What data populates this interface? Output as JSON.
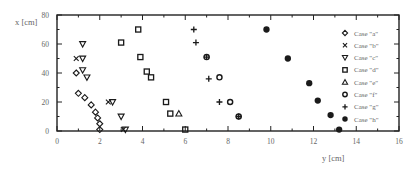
{
  "chart_data": {
    "type": "scatter",
    "title": "",
    "xlabel": "y [cm]",
    "ylabel": "x [cm]",
    "xlim": [
      0,
      16
    ],
    "ylim": [
      0,
      80
    ],
    "xticks": [
      "0",
      "2",
      "4",
      "6",
      "8",
      "10",
      "12",
      "14",
      "16"
    ],
    "yticks": [
      "0",
      "20",
      "40",
      "60",
      "80"
    ],
    "grid": false,
    "legend_position": "right-inside",
    "series": [
      {
        "name": "Case \"a\"",
        "marker": "diamond",
        "points": [
          [
            0.9,
            40
          ],
          [
            1.0,
            26
          ],
          [
            1.3,
            23
          ],
          [
            1.6,
            18
          ],
          [
            1.8,
            13
          ],
          [
            1.9,
            9
          ],
          [
            2.0,
            5
          ],
          [
            2.0,
            1
          ]
        ]
      },
      {
        "name": "Case \"b\"",
        "marker": "x",
        "points": [
          [
            0.9,
            50
          ],
          [
            2.4,
            20
          ],
          [
            3.1,
            1
          ]
        ]
      },
      {
        "name": "Case \"c\"",
        "marker": "triangle-down",
        "points": [
          [
            1.2,
            60
          ],
          [
            1.2,
            50
          ],
          [
            1.2,
            42
          ],
          [
            1.4,
            37
          ],
          [
            2.6,
            20
          ],
          [
            3.0,
            10
          ],
          [
            3.2,
            1
          ]
        ]
      },
      {
        "name": "Case \"d\"",
        "marker": "square",
        "points": [
          [
            3.8,
            70
          ],
          [
            3.0,
            61
          ],
          [
            3.9,
            51
          ],
          [
            4.2,
            41
          ],
          [
            4.4,
            37
          ],
          [
            5.1,
            20
          ],
          [
            5.3,
            12
          ],
          [
            6.0,
            1
          ]
        ]
      },
      {
        "name": "Case \"e\"",
        "marker": "triangle-up",
        "points": [
          [
            5.7,
            12
          ]
        ]
      },
      {
        "name": "Case \"f\"",
        "marker": "circle-open",
        "points": [
          [
            7.0,
            51
          ],
          [
            7.6,
            37
          ],
          [
            8.1,
            20
          ],
          [
            8.5,
            10
          ]
        ]
      },
      {
        "name": "Case \"g\"",
        "marker": "plus",
        "points": [
          [
            6.4,
            70
          ],
          [
            6.5,
            61
          ],
          [
            7.0,
            51
          ],
          [
            7.1,
            36
          ],
          [
            7.6,
            20
          ],
          [
            8.5,
            10
          ]
        ]
      },
      {
        "name": "Case \"h\"",
        "marker": "circle-filled",
        "points": [
          [
            9.8,
            70
          ],
          [
            10.8,
            50
          ],
          [
            11.8,
            33
          ],
          [
            12.2,
            21
          ],
          [
            12.8,
            11
          ],
          [
            13.2,
            1
          ]
        ]
      }
    ]
  },
  "legend": {
    "items": [
      {
        "label": "Case \"a\"",
        "marker": "diamond"
      },
      {
        "label": "Case \"b\"",
        "marker": "x"
      },
      {
        "label": "Case \"c\"",
        "marker": "triangle-down"
      },
      {
        "label": "Case \"d\"",
        "marker": "square"
      },
      {
        "label": "Case \"e\"",
        "marker": "triangle-up"
      },
      {
        "label": "Case \"f\"",
        "marker": "circle-open"
      },
      {
        "label": "Case \"g\"",
        "marker": "plus"
      },
      {
        "label": "Case \"h\"",
        "marker": "circle-filled"
      }
    ]
  },
  "colors": {
    "axis": "#222222",
    "marker": "#1a1a1a",
    "text": "#666666"
  }
}
